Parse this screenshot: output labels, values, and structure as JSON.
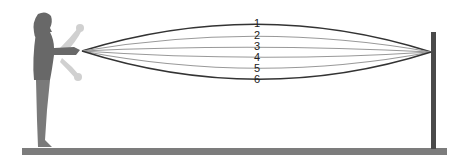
{
  "diagram": {
    "rope_positions": [
      {
        "label": "1",
        "mid_y": 24,
        "color": "#333333",
        "width": 1.6
      },
      {
        "label": "2",
        "mid_y": 36,
        "color": "#9a9a9a",
        "width": 1.2
      },
      {
        "label": "3",
        "mid_y": 47,
        "color": "#9a9a9a",
        "width": 1.2
      },
      {
        "label": "4",
        "mid_y": 57,
        "color": "#9a9a9a",
        "width": 1.2
      },
      {
        "label": "5",
        "mid_y": 68,
        "color": "#9a9a9a",
        "width": 1.2
      },
      {
        "label": "6",
        "mid_y": 79,
        "color": "#333333",
        "width": 1.6
      }
    ],
    "colors": {
      "floor": "#7a7a7a",
      "post": "#4a4a4a",
      "person": "#6a6a6a",
      "ghost_arm": "#c8c8c8"
    }
  }
}
